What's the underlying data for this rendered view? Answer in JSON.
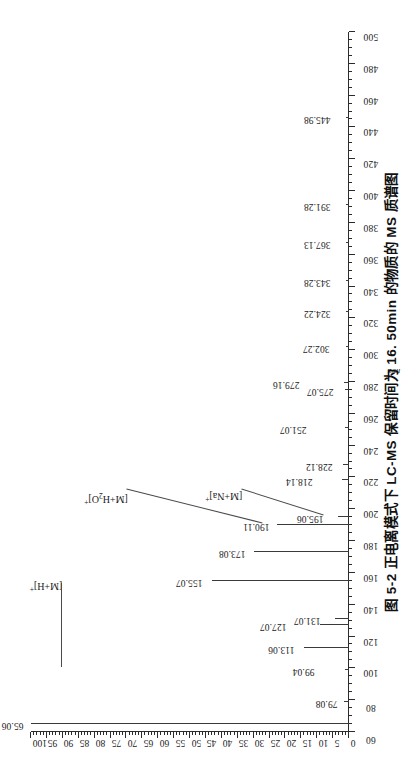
{
  "caption": {
    "text": "图 5-2  正电离模式下 LC-MS 保留时间为 16. 50min 的物质的 MS 质谱图"
  },
  "chart_data": {
    "type": "bar",
    "title": "图 5-2  正电离模式下 LC-MS 保留时间为 16. 50min 的物质的 MS 质谱图",
    "xlabel": "m/z",
    "ylabel": "",
    "xlim": [
      60,
      500
    ],
    "ylim": [
      0,
      100
    ],
    "grid": false,
    "legend": "none",
    "orientation": "rotated-90-ccw",
    "x_major_step": 20,
    "x": [
      65.06,
      79.08,
      99.04,
      113.06,
      127.07,
      131.07,
      155.07,
      173.08,
      190.11,
      195.06,
      218.14,
      228.12,
      251.07,
      275.07,
      279.16,
      302.27,
      324.22,
      343.28,
      367.13,
      391.28,
      445.98
    ],
    "values": [
      100,
      1.6,
      1.4,
      14,
      9,
      4.5,
      43,
      30,
      22.5,
      3.5,
      2.2,
      2.0,
      1.4,
      1.2,
      1.6,
      1.0,
      0.9,
      0.9,
      0.9,
      0.8,
      0.8
    ],
    "point_labels": [
      "65.06",
      "79.08",
      "99.04",
      "113.06",
      "127.07",
      "131.07",
      "155.07",
      "173.08",
      "190.11",
      "195.06",
      "218.14",
      "228.12",
      "251.07",
      "275.07",
      "279.16",
      "302.27",
      "324.22",
      "343.28",
      "367.13",
      "391.28",
      "445.98"
    ],
    "xticks": [
      60,
      80,
      100,
      120,
      140,
      160,
      180,
      200,
      220,
      240,
      260,
      280,
      300,
      320,
      340,
      360,
      380,
      400,
      420,
      440,
      460,
      480,
      500
    ],
    "xticklabels": [
      "60",
      "80",
      "100",
      "120",
      "140",
      "160",
      "180",
      "200",
      "220",
      "240",
      "260",
      "280",
      "300",
      "320",
      "340",
      "360",
      "380",
      "400",
      "420",
      "440",
      "460",
      "480",
      "500"
    ],
    "yticks": [
      0,
      5,
      10,
      15,
      20,
      25,
      30,
      35,
      40,
      45,
      50,
      55,
      60,
      65,
      70,
      75,
      80,
      85,
      90,
      95,
      100
    ],
    "yticklabels": [
      "0",
      "5",
      "10",
      "15",
      "20",
      "25",
      "30",
      "35",
      "40",
      "45",
      "50",
      "55",
      "60",
      "65",
      "70",
      "75",
      "80",
      "85",
      "90",
      "95",
      "100"
    ],
    "annotations": [
      {
        "text": "[M+H]+",
        "html": "[M+H]<sup>+</sup>",
        "target_mz": 155.07
      },
      {
        "text": "[M+H2O]+",
        "html": "[M+H<sub>2</sub>O]<sup>+</sup>",
        "target_mz": 190.11
      },
      {
        "text": "[M+Na]+",
        "html": "[M+Na]<sup>+</sup>",
        "target_mz": 195.06
      }
    ],
    "base_peak": "65.06",
    "colors": {
      "axis": "#2b2b2b",
      "peak": "#3a3a3a",
      "text": "#1a1a1a"
    }
  }
}
